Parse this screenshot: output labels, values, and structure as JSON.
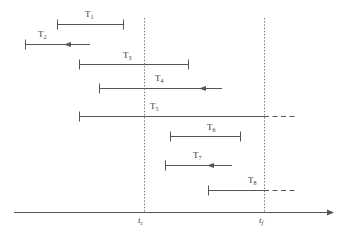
{
  "figure": {
    "type": "timeline-interval-diagram",
    "background_color": "#ffffff",
    "line_color": "#555555",
    "dotted_color": "#777777",
    "text_color": "#3a3a3a",
    "width": 344,
    "height": 234
  },
  "axis": {
    "name": "time-axis",
    "y": 212,
    "x_start": 14,
    "x_end": 334,
    "arrow": "right",
    "markers": [
      {
        "name": "critical-time",
        "label_text": "t",
        "label_sub": "c",
        "x": 144,
        "label_x": 138,
        "label_y": 216,
        "line_top": 18,
        "line_bottom": 212,
        "style": "dotted"
      },
      {
        "name": "final-time",
        "label_text": "t",
        "label_sub": "f",
        "x": 264,
        "label_x": 259,
        "label_y": 216,
        "line_top": 18,
        "line_bottom": 212,
        "style": "dotted"
      }
    ]
  },
  "tasks": [
    {
      "id": "T1",
      "label_text": "T",
      "label_sub": "1",
      "y": 24,
      "x_start": 57,
      "x_end": 124,
      "start_cap": "tick",
      "end_cap": "tick",
      "arrow_marker": null,
      "dashed_from": null,
      "dashed_to": null,
      "label_x": 85,
      "label_y": 10
    },
    {
      "id": "T2",
      "label_text": "T",
      "label_sub": "2",
      "y": 44,
      "x_start": 25,
      "x_end": 90,
      "start_cap": "tick",
      "end_cap": "none",
      "arrow_marker": 70,
      "dashed_from": null,
      "dashed_to": null,
      "label_x": 38,
      "label_y": 30
    },
    {
      "id": "T3",
      "label_text": "T",
      "label_sub": "3",
      "y": 64,
      "x_start": 79,
      "x_end": 189,
      "start_cap": "tick",
      "end_cap": "tick",
      "arrow_marker": null,
      "dashed_from": null,
      "dashed_to": null,
      "label_x": 123,
      "label_y": 51
    },
    {
      "id": "T4",
      "label_text": "T",
      "label_sub": "4",
      "y": 88,
      "x_start": 99,
      "x_end": 222,
      "start_cap": "tick",
      "end_cap": "none",
      "arrow_marker": 205,
      "dashed_from": null,
      "dashed_to": null,
      "label_x": 155,
      "label_y": 74
    },
    {
      "id": "T5",
      "label_text": "T",
      "label_sub": "5",
      "y": 116,
      "x_start": 79,
      "x_end": 264,
      "start_cap": "tick",
      "end_cap": "none",
      "arrow_marker": null,
      "dashed_from": 264,
      "dashed_to": 296,
      "label_x": 150,
      "label_y": 102
    },
    {
      "id": "T6",
      "label_text": "T",
      "label_sub": "6",
      "y": 136,
      "x_start": 170,
      "x_end": 241,
      "start_cap": "tick",
      "end_cap": "tick",
      "arrow_marker": null,
      "dashed_from": null,
      "dashed_to": null,
      "label_x": 207,
      "label_y": 123
    },
    {
      "id": "T7",
      "label_text": "T",
      "label_sub": "7",
      "y": 165,
      "x_start": 165,
      "x_end": 232,
      "start_cap": "tick",
      "end_cap": "none",
      "arrow_marker": 213,
      "dashed_from": null,
      "dashed_to": null,
      "label_x": 193,
      "label_y": 151
    },
    {
      "id": "T8",
      "label_text": "T",
      "label_sub": "8",
      "y": 190,
      "x_start": 208,
      "x_end": 264,
      "start_cap": "tick",
      "end_cap": "none",
      "arrow_marker": null,
      "dashed_from": 264,
      "dashed_to": 296,
      "label_x": 248,
      "label_y": 176
    }
  ]
}
